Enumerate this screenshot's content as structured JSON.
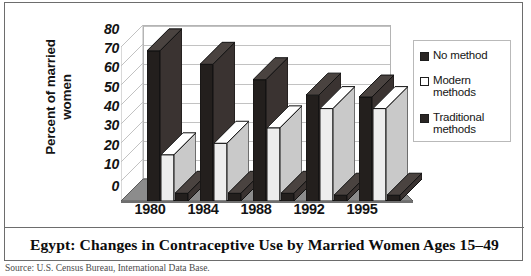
{
  "figure": {
    "title": "Egypt: Changes in Contraceptive Use by Married Women Ages 15–49",
    "source_note": "Source: U.S. Census Bureau, International Data Base."
  },
  "axes": {
    "y_title_line1": "Percent of married",
    "y_title_line2": "women",
    "y_ticks": [
      "80",
      "70",
      "60",
      "50",
      "40",
      "30",
      "20",
      "10",
      "0"
    ]
  },
  "legend": {
    "items": [
      {
        "label": "No method",
        "swatch": "dark",
        "color": "#2a2624"
      },
      {
        "label": "Modern methods",
        "swatch": "light",
        "color": "#ffffff"
      },
      {
        "label": "Traditional methods",
        "swatch": "dark",
        "color": "#2a2624"
      }
    ]
  },
  "chart_data": {
    "type": "bar",
    "title": "Egypt: Changes in Contraceptive Use by Married Women Ages 15–49",
    "xlabel": "",
    "ylabel": "Percent of married women",
    "ylim": [
      0,
      80
    ],
    "ytick_step": 10,
    "grid": true,
    "legend_position": "right",
    "three_d": true,
    "categories": [
      "1980",
      "1984",
      "1988",
      "1992",
      "1995"
    ],
    "series": [
      {
        "name": "No method",
        "values": [
          78,
          71,
          63,
          55,
          54
        ],
        "color": "#231f1d"
      },
      {
        "name": "Modern methods",
        "values": [
          24,
          30,
          38,
          48,
          48
        ],
        "color": "#f2f2f2"
      },
      {
        "name": "Traditional methods",
        "values": [
          4,
          4,
          4,
          3,
          3
        ],
        "color": "#231f1d"
      }
    ]
  }
}
